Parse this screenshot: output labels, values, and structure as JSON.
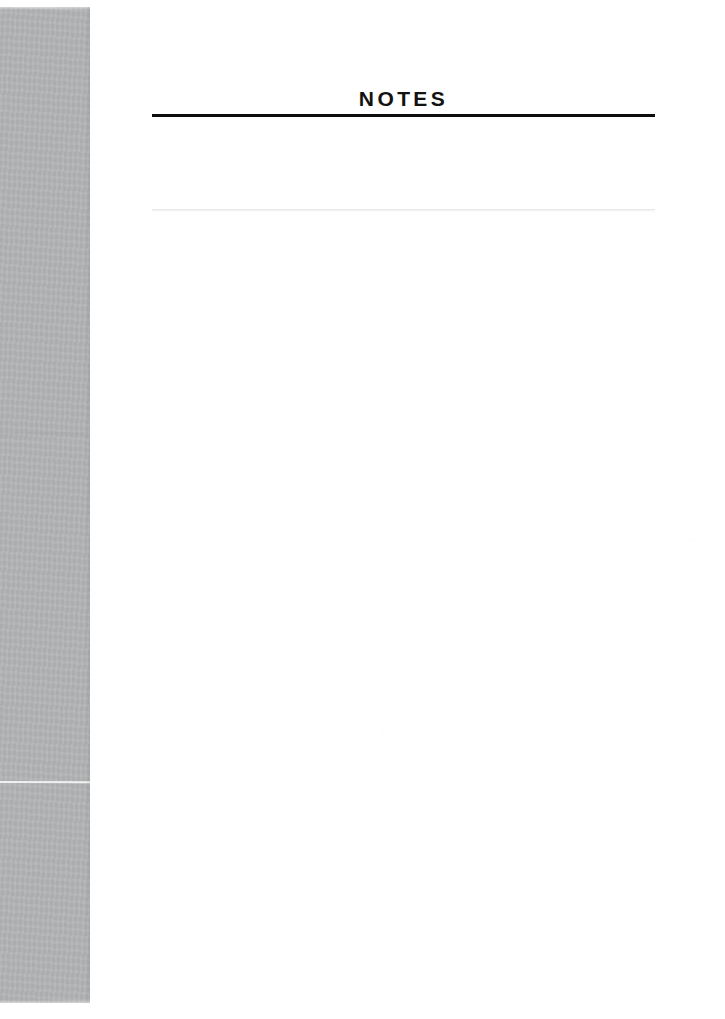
{
  "document": {
    "page_title": "NOTES",
    "body_text": "",
    "colors": {
      "page_background": "#ffffff",
      "gutter_band": "#b3b4b6",
      "rule": "#0d0d0d",
      "title_text": "#121212"
    }
  }
}
